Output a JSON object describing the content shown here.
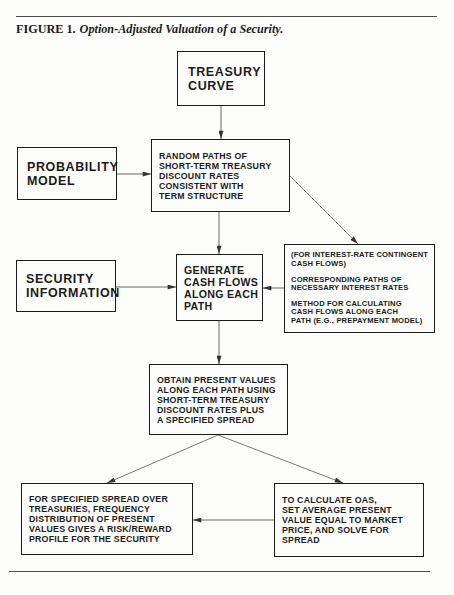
{
  "figure": {
    "label": "FIGURE 1.",
    "title": "Option-Adjusted Valuation of a Security."
  },
  "nodes": {
    "treasury_curve": {
      "lines": [
        "TREASURY",
        "CURVE"
      ]
    },
    "probability_model": {
      "lines": [
        "PROBABILITY",
        "MODEL"
      ]
    },
    "random_paths": {
      "lines": [
        "RANDOM PATHS OF",
        "SHORT-TERM TREASURY",
        "DISCOUNT RATES",
        "CONSISTENT WITH",
        "TERM STRUCTURE"
      ]
    },
    "security_information": {
      "lines": [
        "SECURITY",
        "INFORMATION"
      ]
    },
    "generate_cash_flows": {
      "lines": [
        "GENERATE",
        "CASH FLOWS",
        "ALONG EACH",
        "PATH"
      ]
    },
    "contingent_inputs": {
      "paragraphs": [
        [
          "(FOR INTEREST-RATE CONTINGENT",
          "CASH FLOWS)"
        ],
        [
          "CORRESPONDING PATHS OF",
          "NECESSARY INTEREST RATES"
        ],
        [
          "METHOD FOR CALCULATING",
          "CASH FLOWS ALONG EACH",
          "PATH (E.G., PREPAYMENT MODEL)"
        ]
      ]
    },
    "obtain_present_values": {
      "lines": [
        "OBTAIN PRESENT VALUES",
        "ALONG EACH PATH USING",
        "SHORT-TERM TREASURY",
        "DISCOUNT RATES PLUS",
        "A SPECIFIED SPREAD"
      ]
    },
    "risk_reward_profile": {
      "lines": [
        "FOR SPECIFIED SPREAD OVER",
        "TREASURIES, FREQUENCY",
        "DISTRIBUTION OF PRESENT",
        "VALUES GIVES A RISK/REWARD",
        "PROFILE FOR THE SECURITY"
      ]
    },
    "calculate_oas": {
      "lines": [
        "TO CALCULATE OAS,",
        "SET AVERAGE PRESENT",
        "VALUE EQUAL TO MARKET",
        "PRICE, AND SOLVE FOR",
        "SPREAD"
      ]
    }
  },
  "edges": [
    {
      "from": "treasury_curve",
      "to": "random_paths"
    },
    {
      "from": "probability_model",
      "to": "random_paths"
    },
    {
      "from": "random_paths",
      "to": "generate_cash_flows"
    },
    {
      "from": "random_paths",
      "to": "contingent_inputs"
    },
    {
      "from": "security_information",
      "to": "generate_cash_flows"
    },
    {
      "from": "contingent_inputs",
      "to": "generate_cash_flows"
    },
    {
      "from": "generate_cash_flows",
      "to": "obtain_present_values"
    },
    {
      "from": "obtain_present_values",
      "to": "risk_reward_profile"
    },
    {
      "from": "obtain_present_values",
      "to": "calculate_oas"
    },
    {
      "from": "calculate_oas",
      "to": "risk_reward_profile"
    }
  ],
  "colors": {
    "ink": "#1b1b1b",
    "rule": "#4a4a4a",
    "line": "#555555",
    "paper": "#fdfdfb"
  }
}
